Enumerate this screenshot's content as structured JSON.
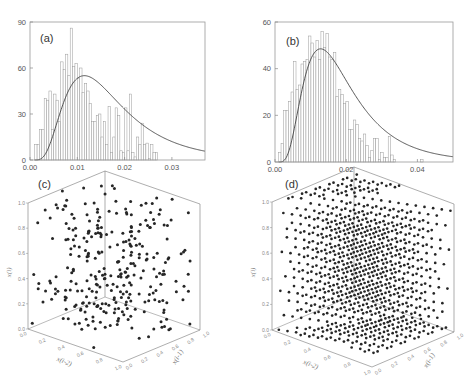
{
  "chart_data": [
    {
      "id": "a",
      "type": "bar",
      "subtype": "histogram_with_fit",
      "panel_label": "(a)",
      "xlim": [
        0.0,
        0.037
      ],
      "ylim": [
        0,
        90
      ],
      "xticks": [
        "0.00",
        "0.01",
        "0.02",
        "0.03"
      ],
      "xtick_values": [
        0.0,
        0.01,
        0.02,
        0.03
      ],
      "yticks": [
        "0",
        "30",
        "60",
        "90"
      ],
      "ytick_values": [
        0,
        30,
        60,
        90
      ],
      "bin_width": 0.0005,
      "bin_start": 0.001,
      "values": [
        10,
        10,
        20,
        20,
        40,
        39,
        45,
        20,
        43,
        39,
        25,
        64,
        59,
        69,
        55,
        86,
        61,
        63,
        53,
        60,
        44,
        50,
        45,
        37,
        25,
        25,
        29,
        30,
        15,
        25,
        10,
        35,
        5,
        15,
        34,
        29,
        6,
        5,
        34,
        6,
        43,
        5,
        2,
        15,
        10,
        24,
        10,
        11,
        1,
        10,
        5,
        5
      ],
      "fit_curve": {
        "type": "lognormal",
        "peak_x": 0.0115,
        "peak_y": 55,
        "color": "#444444"
      },
      "bar_color": "#ffffff",
      "bar_edge": "#999999",
      "grid": false
    },
    {
      "id": "b",
      "type": "bar",
      "subtype": "histogram_with_fit",
      "panel_label": "(b)",
      "xlim": [
        0.0,
        0.05
      ],
      "ylim": [
        0,
        60
      ],
      "xticks": [
        "0.00",
        "0.02",
        "0.04"
      ],
      "xtick_values": [
        0.0,
        0.02,
        0.04
      ],
      "yticks": [
        "0",
        "20",
        "40",
        "60"
      ],
      "ytick_values": [
        0,
        20,
        40,
        60
      ],
      "bin_width": 0.0007,
      "bin_start": 0.001,
      "values": [
        4,
        8,
        22,
        22,
        26,
        30,
        43,
        31,
        33,
        42,
        43,
        44,
        54,
        51,
        45,
        52,
        44,
        56,
        49,
        55,
        45,
        44,
        47,
        28,
        31,
        29,
        25,
        26,
        14,
        14,
        18,
        16,
        10,
        9,
        12,
        7,
        2,
        5,
        10,
        10,
        1,
        4,
        2,
        2,
        11,
        3,
        1,
        0,
        0,
        0,
        0,
        0,
        0,
        0,
        0,
        0,
        0,
        1
      ],
      "fit_curve": {
        "type": "lognormal",
        "peak_x": 0.0128,
        "peak_y": 48.5,
        "color": "#444444"
      },
      "bar_color": "#ffffff",
      "bar_edge": "#999999",
      "grid": false
    },
    {
      "id": "c",
      "type": "scatter",
      "subtype": "scatter3d",
      "panel_label": "(c)",
      "description": "Random 3D point distribution in unit cube",
      "zlabel": "x(i)",
      "xlabel": "x(i-2)",
      "ylabel": "x(i-1)",
      "zticks": [
        "0.0",
        "0.2",
        "0.4",
        "0.6",
        "0.8",
        "1.0"
      ],
      "xticks": [
        "0.0",
        "0.2",
        "0.4",
        "0.6",
        "0.8",
        "1.0"
      ],
      "yticks": [
        "0.0",
        "0.2",
        "0.4",
        "0.6",
        "0.8",
        "1.0"
      ],
      "n_points_approx": 300,
      "marker_color": "#222222"
    },
    {
      "id": "d",
      "type": "scatter",
      "subtype": "scatter3d",
      "panel_label": "(d)",
      "description": "Lattice-structured 3D point distribution (points on parallel planes) in unit cube",
      "zlabel": "x(i)",
      "xlabel": "x(i-2)",
      "ylabel": "x(i-1)",
      "zticks": [
        "0.0",
        "0.2",
        "0.4",
        "0.6",
        "0.8",
        "1.0"
      ],
      "xticks": [
        "0.0",
        "0.2",
        "0.4",
        "0.6",
        "0.8",
        "1.0"
      ],
      "yticks": [
        "0.0",
        "0.2",
        "0.4",
        "0.6",
        "0.8",
        "1.0"
      ],
      "n_points_approx": 1000,
      "marker_color": "#222222"
    }
  ],
  "labels": {
    "a": "(a)",
    "b": "(b)",
    "c": "(c)",
    "d": "(d)",
    "z_axis": "x(i)",
    "x_axis": "x(i-2)",
    "y_axis": "x(i-1)"
  }
}
